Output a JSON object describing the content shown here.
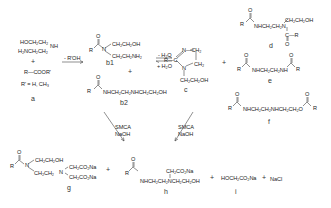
{
  "reactants": {
    "amine_line1": "HOCH₂CH₂",
    "amine_nh": "NH",
    "amine_line2": "H₂NCH₂CH₂",
    "plus": "+",
    "ester": "R—COOR'",
    "rprime": "R' = H, CH₃",
    "label": "a"
  },
  "step1": {
    "condition": "- R'OH"
  },
  "b1": {
    "r": "R",
    "o": "O",
    "n": "N",
    "branch_top": "CH₂CH₂OH",
    "branch_bottom": "CH₂CH₂NH₂",
    "label": "b1"
  },
  "b_plus": "+",
  "b2": {
    "r": "R",
    "o": "O",
    "chain": "NHCH₂CH₂NHCH₂CH₂OH",
    "label": "b2"
  },
  "step2": {
    "top": "- H₂O",
    "bottom": "+ H₂O"
  },
  "c": {
    "r": "R—C",
    "n_top": "N—CH₂",
    "ch2": "CH₂",
    "n_bottom": "N",
    "chain": "CH₂CH₂OH",
    "label": "c"
  },
  "c_plus": "+",
  "d": {
    "r": "R",
    "o": "O",
    "chain": "NHCH₂CH₂N",
    "branch": "CH₂CH₂OH",
    "acyl": "C—R",
    "acyl_o": "O",
    "label": "d"
  },
  "e": {
    "r": "R",
    "o": "O",
    "chain": "NHCH₂CH₂NH",
    "r2": "R",
    "o2": "O",
    "label": "e"
  },
  "f": {
    "r": "R",
    "o": "O",
    "chain": "NHCH₂CH₂NHCH₂CH₂O",
    "r2": "R",
    "o2": "O",
    "label": "f"
  },
  "step3_left": {
    "line1": "SMCA",
    "line2": "NaOH"
  },
  "step3_right": {
    "line1": "SMCA",
    "line2": "NaOH"
  },
  "g": {
    "r": "R",
    "o": "O",
    "n": "N",
    "branch_top": "CH₂CH₂OH",
    "branch_bottom": "CH₂CH₂",
    "n2": "N",
    "ca1": "CH₂CO₂Na",
    "ca2": "CH₂CO₂Na",
    "label": "g"
  },
  "g_plus": "+",
  "h": {
    "r": "R",
    "o": "O",
    "chain": "NHCH₂CH₂NCH₂CH₂OH",
    "branch": "CH₂CO₂Na",
    "label": "h"
  },
  "h_plus": "+",
  "i": {
    "formula": "HOCH₂CO₂Na",
    "label": "i"
  },
  "i_plus": "+",
  "nacl": "NaCl"
}
